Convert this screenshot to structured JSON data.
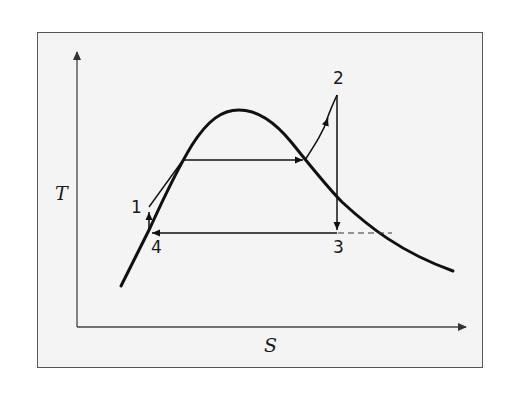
{
  "diagram": {
    "type": "T-s diagram (vapor compression / Rankine-type cycle)",
    "axes": {
      "y_label": "T",
      "x_label": "S"
    },
    "points": [
      {
        "id": "1",
        "label": "1"
      },
      {
        "id": "2",
        "label": "2"
      },
      {
        "id": "3",
        "label": "3"
      },
      {
        "id": "4",
        "label": "4"
      }
    ],
    "colors": {
      "frame_border": "#555555",
      "frame_fill": "#f4f4f4",
      "line": "#111111",
      "axis": "#444444"
    }
  }
}
